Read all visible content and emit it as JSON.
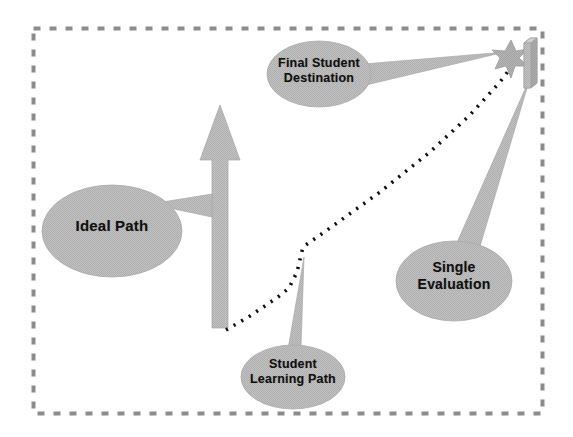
{
  "diagram": {
    "frame": {
      "style": "dashed",
      "color": "#8c8c8c",
      "x": 33,
      "y": 28,
      "width": 509,
      "height": 385
    },
    "palette": {
      "shape_fill": "#b9b9b9",
      "shape_stroke": "#a8a8a8",
      "text_color": "#111111",
      "dotted_path_color": "#000000",
      "frame_color": "#8c8c8c",
      "background": "#ffffff"
    },
    "callouts": [
      {
        "id": "ideal-path",
        "label": "Ideal Path",
        "shape": "ellipse-callout",
        "cx": 112,
        "cy": 231,
        "rx": 70,
        "ry": 46,
        "points_to": "ideal-path-arrow"
      },
      {
        "id": "final-student-destination",
        "label": "Final  Student\nDestination",
        "shape": "ellipse-callout",
        "cx": 319,
        "cy": 74,
        "rx": 52,
        "ry": 33,
        "points_to": "destination-star"
      },
      {
        "id": "student-learning-path",
        "label": "Student\nLearning Path",
        "shape": "ellipse-callout",
        "cx": 293,
        "cy": 377,
        "rx": 52,
        "ry": 32,
        "points_to": "dotted-learning-path"
      },
      {
        "id": "single-evaluation",
        "label": "Single\nEvaluation",
        "shape": "ellipse-callout",
        "cx": 454,
        "cy": 281,
        "rx": 58,
        "ry": 40,
        "points_to": "evaluation-bar"
      }
    ],
    "arrow": {
      "id": "ideal-path-arrow",
      "direction": "up",
      "tip_x": 220,
      "tip_y": 105,
      "base_y": 328,
      "shaft_width": 16,
      "head_width": 40
    },
    "star": {
      "id": "destination-star",
      "cx": 511,
      "cy": 57,
      "points": 7,
      "outer_radius": 17,
      "inner_radius": 7
    },
    "bar": {
      "id": "evaluation-bar",
      "x": 524,
      "y": 38,
      "width": 13,
      "height": 50,
      "depth": 5
    },
    "learning_path": {
      "id": "dotted-learning-path",
      "style": "dotted",
      "stroke_width": 3.6,
      "dash": "2 7",
      "points": [
        [
          226,
          330
        ],
        [
          250,
          316
        ],
        [
          278,
          297
        ],
        [
          289,
          288
        ],
        [
          297,
          272
        ],
        [
          303,
          247
        ],
        [
          330,
          228
        ],
        [
          380,
          192
        ],
        [
          430,
          152
        ],
        [
          470,
          115
        ],
        [
          500,
          82
        ],
        [
          512,
          66
        ]
      ]
    }
  }
}
